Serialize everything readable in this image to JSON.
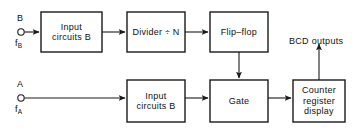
{
  "diagram": {
    "stroke_color": "#1a1a1a",
    "text_color": "#101010",
    "background": "#ffffff",
    "blocks": [
      {
        "id": "input-circuits-b-top",
        "label": "Input\ncircuits B",
        "x": 41,
        "y": 12,
        "w": 61,
        "h": 40
      },
      {
        "id": "divider",
        "label": "Divider ÷ N",
        "x": 127,
        "y": 12,
        "w": 58,
        "h": 40
      },
      {
        "id": "flip-flop",
        "label": "Flip–flop",
        "x": 210,
        "y": 12,
        "w": 58,
        "h": 40
      },
      {
        "id": "input-circuits-b-bottom",
        "label": "Input\ncircuits B",
        "x": 127,
        "y": 80,
        "w": 58,
        "h": 42
      },
      {
        "id": "gate",
        "label": "Gate",
        "x": 210,
        "y": 80,
        "w": 58,
        "h": 42
      },
      {
        "id": "counter-register-display",
        "label": "Counter\nregister\ndisplay",
        "x": 293,
        "y": 80,
        "w": 52,
        "h": 42
      }
    ],
    "terminals": [
      {
        "id": "terminal-b",
        "top_label": "B",
        "bottom_label": "f",
        "bottom_sub": "B",
        "cx": 21,
        "cy": 32,
        "r": 3.2
      },
      {
        "id": "terminal-a",
        "top_label": "A",
        "bottom_label": "f",
        "bottom_sub": "A",
        "cx": 21,
        "cy": 98,
        "r": 3.2
      }
    ],
    "annotations": [
      {
        "id": "bcd-outputs",
        "text": "BCD outputs",
        "x": 289,
        "y": 36
      }
    ],
    "connections": [
      {
        "id": "b-to-input-b",
        "from": "terminal-b",
        "to": "input-circuits-b-top"
      },
      {
        "id": "input-b-to-divider",
        "from": "input-circuits-b-top",
        "to": "divider"
      },
      {
        "id": "divider-to-flipflop",
        "from": "divider",
        "to": "flip-flop"
      },
      {
        "id": "flipflop-to-gate",
        "from": "flip-flop",
        "to": "gate"
      },
      {
        "id": "a-to-input-a",
        "from": "terminal-a",
        "to": "input-circuits-b-bottom"
      },
      {
        "id": "input-a-to-gate",
        "from": "input-circuits-b-bottom",
        "to": "gate"
      },
      {
        "id": "gate-to-counter",
        "from": "gate",
        "to": "counter-register-display"
      },
      {
        "id": "counter-to-bcd",
        "from": "counter-register-display",
        "to": "bcd-outputs"
      }
    ]
  }
}
